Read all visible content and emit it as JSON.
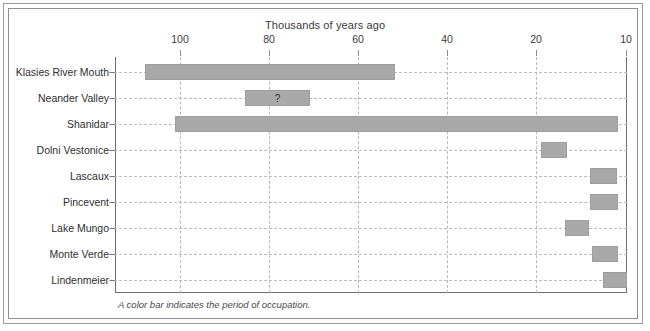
{
  "frame": {
    "border_color": "#9a9a9a",
    "background": "#ffffff"
  },
  "caption": "A color bar indicates the period of occupation.",
  "chart_data": {
    "type": "bar",
    "orientation": "horizontal",
    "title": "Thousands of years ago",
    "xlabel": "Thousands of years ago",
    "ylabel": "",
    "grid": true,
    "legend": false,
    "axis_note": "Horizontal axis runs right-to-left from 100 to 10 thousand years ago; spacing 100-80-60-40-20 is uniform, 20-10 is a half interval.",
    "xticks": [
      100,
      80,
      60,
      40,
      20,
      10
    ],
    "xtick_labels": [
      "100",
      "80",
      "60",
      "40",
      "20",
      "10"
    ],
    "xlim": [
      100,
      10
    ],
    "bar_color": "#a9a9a9",
    "categories": [
      "Klasies River Mouth",
      "Neander Valley",
      "Shanidar",
      "Dolni Vestonice",
      "Lascaux",
      "Pincevent",
      "Lake Mungo",
      "Monte Verde",
      "Lindenmeier"
    ],
    "ranges": [
      {
        "site": "Klasies River Mouth",
        "start": 115,
        "end": 58,
        "label": ""
      },
      {
        "site": "Neander Valley",
        "start": 85,
        "end": 70,
        "label": "?"
      },
      {
        "site": "Shanidar",
        "start": 101,
        "end": 11,
        "label": ""
      },
      {
        "site": "Dolni Vestonice",
        "start": 27,
        "end": 24,
        "label": ""
      },
      {
        "site": "Lascaux",
        "start": 17,
        "end": 13,
        "label": ""
      },
      {
        "site": "Pincevent",
        "start": 16,
        "end": 12,
        "label": ""
      },
      {
        "site": "Lake Mungo",
        "start": 22,
        "end": 19,
        "label": ""
      },
      {
        "site": "Monte Verde",
        "start": 16,
        "end": 12,
        "label": ""
      },
      {
        "site": "Lindenmeier",
        "start": 13,
        "end": 10,
        "label": ""
      }
    ],
    "bar_pixels": [
      {
        "site": "Klasies River Mouth",
        "x": 30,
        "w": 250,
        "label": ""
      },
      {
        "site": "Neander Valley",
        "x": 130,
        "w": 65,
        "label": "?"
      },
      {
        "site": "Shanidar",
        "x": 60,
        "w": 443,
        "label": ""
      },
      {
        "site": "Dolni Vestonice",
        "x": 426,
        "w": 26,
        "label": ""
      },
      {
        "site": "Lascaux",
        "x": 475,
        "w": 27,
        "label": ""
      },
      {
        "site": "Pincevent",
        "x": 475,
        "w": 28,
        "label": ""
      },
      {
        "site": "Lake Mungo",
        "x": 450,
        "w": 24,
        "label": ""
      },
      {
        "site": "Monte Verde",
        "x": 477,
        "w": 26,
        "label": ""
      },
      {
        "site": "Lindenmeier",
        "x": 488,
        "w": 24,
        "label": ""
      }
    ],
    "xtick_pixels": [
      65,
      154,
      243,
      332,
      421,
      511
    ]
  }
}
